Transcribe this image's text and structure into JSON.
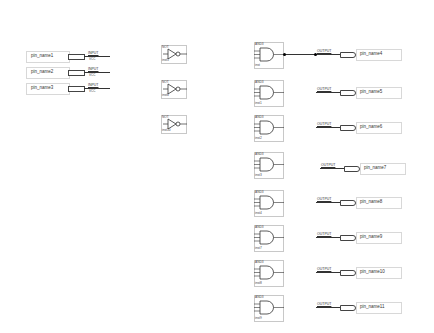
{
  "canvas": {
    "grid": "dotted",
    "background": "#ffffff",
    "grid_color": "#b8b8b8"
  },
  "input_pins": [
    {
      "name": "pin_name1",
      "type": "INPUT",
      "default": "VCC"
    },
    {
      "name": "pin_name2",
      "type": "INPUT",
      "default": "VCC"
    },
    {
      "name": "pin_name3",
      "type": "INPUT",
      "default": "VCC"
    }
  ],
  "not_gates": [
    {
      "type": "NOT",
      "instance": "inst5"
    },
    {
      "type": "NOT",
      "instance": "inst6"
    },
    {
      "type": "NOT",
      "instance": "inst10"
    }
  ],
  "and_gates": [
    {
      "type": "AND3",
      "instance": "inst"
    },
    {
      "type": "AND3",
      "instance": "inst1"
    },
    {
      "type": "AND3",
      "instance": "inst2"
    },
    {
      "type": "AND3",
      "instance": "inst3"
    },
    {
      "type": "AND3",
      "instance": "inst4"
    },
    {
      "type": "AND3",
      "instance": "inst7"
    },
    {
      "type": "AND3",
      "instance": "inst8"
    },
    {
      "type": "AND3",
      "instance": "inst9"
    }
  ],
  "output_pins": [
    {
      "name": "pin_name4",
      "type": "OUTPUT"
    },
    {
      "name": "pin_name5",
      "type": "OUTPUT"
    },
    {
      "name": "pin_name6",
      "type": "OUTPUT"
    },
    {
      "name": "pin_name7",
      "type": "OUTPUT"
    },
    {
      "name": "pin_name8",
      "type": "OUTPUT"
    },
    {
      "name": "pin_name9",
      "type": "OUTPUT"
    },
    {
      "name": "pin_name10",
      "type": "OUTPUT"
    },
    {
      "name": "pin_name11",
      "type": "OUTPUT"
    }
  ]
}
